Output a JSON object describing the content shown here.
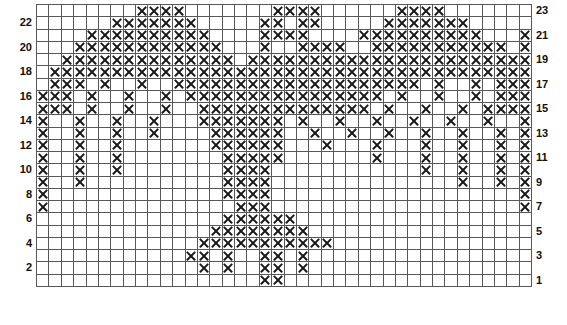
{
  "chart": {
    "title": "",
    "type": "knitting-colorwork-chart",
    "columns": 40,
    "rows": 23,
    "symbol_on": "X",
    "symbol_off": "",
    "colors": {
      "grid_line": "#58585a",
      "symbol": "#1a1a1a",
      "cell_background": "#ffffff",
      "label": "#0f0f0f"
    },
    "row_labels_left": [
      "22",
      "20",
      "18",
      "16",
      "14",
      "12",
      "10",
      "8",
      "6",
      "4",
      "2"
    ],
    "row_labels_right": [
      "23",
      "21",
      "19",
      "17",
      "15",
      "13",
      "11",
      "9",
      "7",
      "5",
      "3",
      "1"
    ],
    "row_number_order": "bottom-to-top",
    "rows_data": [
      {
        "row": 23,
        "label": "23",
        "label_side": "right",
        "cells": [
          0,
          0,
          0,
          0,
          0,
          0,
          0,
          0,
          1,
          1,
          1,
          1,
          0,
          0,
          0,
          0,
          0,
          0,
          0,
          1,
          1,
          1,
          1,
          0,
          0,
          0,
          0,
          0,
          0,
          1,
          1,
          1,
          1,
          0,
          0,
          0,
          0,
          0,
          0,
          0
        ]
      },
      {
        "row": 22,
        "label": "22",
        "label_side": "left",
        "cells": [
          0,
          0,
          0,
          0,
          0,
          0,
          1,
          1,
          1,
          1,
          1,
          1,
          1,
          0,
          0,
          0,
          0,
          0,
          1,
          1,
          0,
          1,
          1,
          0,
          0,
          0,
          0,
          0,
          1,
          1,
          1,
          1,
          1,
          1,
          1,
          0,
          0,
          0,
          0,
          0
        ]
      },
      {
        "row": 21,
        "label": "21",
        "label_side": "right",
        "cells": [
          0,
          0,
          0,
          0,
          1,
          1,
          1,
          1,
          1,
          1,
          1,
          1,
          1,
          1,
          0,
          0,
          0,
          0,
          1,
          1,
          1,
          1,
          0,
          0,
          0,
          0,
          1,
          1,
          1,
          1,
          1,
          1,
          1,
          1,
          1,
          1,
          0,
          0,
          0,
          1
        ]
      },
      {
        "row": 20,
        "label": "20",
        "label_side": "left",
        "cells": [
          0,
          0,
          0,
          1,
          1,
          1,
          1,
          1,
          1,
          1,
          1,
          1,
          1,
          1,
          1,
          0,
          0,
          0,
          1,
          0,
          0,
          1,
          1,
          1,
          1,
          0,
          0,
          1,
          1,
          1,
          1,
          1,
          1,
          1,
          1,
          1,
          1,
          1,
          0,
          1
        ]
      },
      {
        "row": 19,
        "label": "19",
        "label_side": "right",
        "cells": [
          0,
          0,
          1,
          1,
          1,
          1,
          1,
          1,
          1,
          1,
          1,
          1,
          1,
          1,
          1,
          1,
          0,
          1,
          1,
          1,
          1,
          1,
          1,
          1,
          1,
          1,
          1,
          1,
          1,
          1,
          1,
          1,
          1,
          1,
          1,
          1,
          1,
          1,
          1,
          1
        ]
      },
      {
        "row": 18,
        "label": "18",
        "label_side": "left",
        "cells": [
          0,
          1,
          1,
          1,
          1,
          1,
          1,
          1,
          1,
          1,
          1,
          1,
          1,
          1,
          1,
          1,
          1,
          1,
          1,
          1,
          1,
          1,
          1,
          1,
          1,
          1,
          1,
          1,
          1,
          1,
          1,
          1,
          1,
          1,
          1,
          1,
          1,
          1,
          1,
          1
        ]
      },
      {
        "row": 17,
        "label": "17",
        "label_side": "right",
        "cells": [
          0,
          1,
          1,
          1,
          0,
          1,
          0,
          0,
          1,
          0,
          0,
          1,
          1,
          1,
          1,
          1,
          1,
          1,
          1,
          1,
          1,
          1,
          1,
          1,
          1,
          1,
          1,
          1,
          1,
          1,
          1,
          0,
          1,
          0,
          0,
          1,
          0,
          1,
          1,
          1
        ]
      },
      {
        "row": 16,
        "label": "16",
        "label_side": "left",
        "cells": [
          1,
          1,
          1,
          0,
          1,
          0,
          0,
          1,
          0,
          0,
          1,
          0,
          1,
          1,
          1,
          1,
          1,
          1,
          1,
          1,
          1,
          1,
          1,
          1,
          1,
          1,
          1,
          1,
          0,
          1,
          0,
          0,
          1,
          0,
          0,
          1,
          0,
          1,
          1,
          1
        ]
      },
      {
        "row": 15,
        "label": "15",
        "label_side": "right",
        "cells": [
          1,
          1,
          1,
          0,
          1,
          0,
          0,
          1,
          0,
          0,
          1,
          0,
          0,
          1,
          1,
          1,
          1,
          1,
          1,
          1,
          1,
          1,
          1,
          1,
          1,
          1,
          1,
          0,
          1,
          0,
          0,
          1,
          0,
          0,
          1,
          0,
          1,
          1,
          1,
          1
        ]
      },
      {
        "row": 14,
        "label": "14",
        "label_side": "left",
        "cells": [
          1,
          0,
          0,
          1,
          0,
          0,
          1,
          0,
          0,
          1,
          0,
          0,
          0,
          1,
          1,
          1,
          1,
          1,
          1,
          1,
          0,
          1,
          0,
          0,
          1,
          0,
          0,
          1,
          0,
          0,
          1,
          0,
          0,
          1,
          0,
          0,
          1,
          0,
          0,
          1
        ]
      },
      {
        "row": 13,
        "label": "13",
        "label_side": "right",
        "cells": [
          1,
          0,
          0,
          1,
          0,
          0,
          1,
          0,
          0,
          1,
          0,
          0,
          0,
          0,
          1,
          1,
          1,
          1,
          1,
          1,
          0,
          0,
          1,
          0,
          0,
          1,
          0,
          0,
          1,
          0,
          0,
          1,
          0,
          0,
          1,
          0,
          0,
          1,
          0,
          1
        ]
      },
      {
        "row": 12,
        "label": "12",
        "label_side": "left",
        "cells": [
          1,
          0,
          0,
          1,
          0,
          0,
          1,
          0,
          0,
          0,
          0,
          0,
          0,
          0,
          1,
          1,
          1,
          1,
          1,
          1,
          0,
          0,
          0,
          1,
          0,
          0,
          0,
          1,
          0,
          0,
          0,
          1,
          0,
          0,
          1,
          0,
          0,
          1,
          0,
          1
        ]
      },
      {
        "row": 11,
        "label": "11",
        "label_side": "right",
        "cells": [
          1,
          0,
          0,
          1,
          0,
          0,
          1,
          0,
          0,
          0,
          0,
          0,
          0,
          0,
          0,
          1,
          1,
          1,
          1,
          1,
          0,
          0,
          0,
          0,
          0,
          0,
          0,
          1,
          0,
          0,
          0,
          1,
          0,
          0,
          1,
          0,
          0,
          1,
          0,
          1
        ]
      },
      {
        "row": 10,
        "label": "10",
        "label_side": "left",
        "cells": [
          1,
          0,
          0,
          1,
          0,
          0,
          1,
          0,
          0,
          0,
          0,
          0,
          0,
          0,
          0,
          1,
          1,
          1,
          1,
          0,
          0,
          0,
          0,
          0,
          0,
          0,
          0,
          0,
          0,
          0,
          0,
          1,
          0,
          0,
          1,
          0,
          0,
          1,
          0,
          1
        ]
      },
      {
        "row": 9,
        "label": "9",
        "label_side": "right",
        "cells": [
          1,
          0,
          0,
          1,
          0,
          0,
          0,
          0,
          0,
          0,
          0,
          0,
          0,
          0,
          0,
          1,
          1,
          1,
          1,
          0,
          0,
          0,
          0,
          0,
          0,
          0,
          0,
          0,
          0,
          0,
          0,
          0,
          0,
          0,
          1,
          0,
          0,
          1,
          0,
          1
        ]
      },
      {
        "row": 8,
        "label": "8",
        "label_side": "left",
        "cells": [
          1,
          0,
          0,
          0,
          0,
          0,
          0,
          0,
          0,
          0,
          0,
          0,
          0,
          0,
          0,
          1,
          1,
          1,
          1,
          0,
          0,
          0,
          0,
          0,
          0,
          0,
          0,
          0,
          0,
          0,
          0,
          0,
          0,
          0,
          0,
          0,
          0,
          0,
          0,
          1
        ]
      },
      {
        "row": 7,
        "label": "7",
        "label_side": "right",
        "cells": [
          1,
          0,
          0,
          0,
          0,
          0,
          0,
          0,
          0,
          0,
          0,
          0,
          0,
          0,
          0,
          0,
          1,
          1,
          1,
          0,
          0,
          0,
          0,
          0,
          0,
          0,
          0,
          0,
          0,
          0,
          0,
          0,
          0,
          0,
          0,
          0,
          0,
          0,
          0,
          1
        ]
      },
      {
        "row": 6,
        "label": "6",
        "label_side": "left",
        "cells": [
          0,
          0,
          0,
          0,
          0,
          0,
          0,
          0,
          0,
          0,
          0,
          0,
          0,
          0,
          0,
          1,
          1,
          1,
          1,
          1,
          1,
          0,
          0,
          0,
          0,
          0,
          0,
          0,
          0,
          0,
          0,
          0,
          0,
          0,
          0,
          0,
          0,
          0,
          0,
          0
        ]
      },
      {
        "row": 5,
        "label": "5",
        "label_side": "right",
        "cells": [
          0,
          0,
          0,
          0,
          0,
          0,
          0,
          0,
          0,
          0,
          0,
          0,
          0,
          0,
          1,
          1,
          1,
          1,
          1,
          1,
          1,
          1,
          0,
          0,
          0,
          0,
          0,
          0,
          0,
          0,
          0,
          0,
          0,
          0,
          0,
          0,
          0,
          0,
          0,
          0
        ]
      },
      {
        "row": 4,
        "label": "4",
        "label_side": "left",
        "cells": [
          0,
          0,
          0,
          0,
          0,
          0,
          0,
          0,
          0,
          0,
          0,
          0,
          0,
          1,
          1,
          1,
          1,
          1,
          1,
          1,
          1,
          1,
          1,
          1,
          0,
          0,
          0,
          0,
          0,
          0,
          0,
          0,
          0,
          0,
          0,
          0,
          0,
          0,
          0,
          0
        ]
      },
      {
        "row": 3,
        "label": "3",
        "label_side": "right",
        "cells": [
          0,
          0,
          0,
          0,
          0,
          0,
          0,
          0,
          0,
          0,
          0,
          0,
          1,
          1,
          0,
          1,
          0,
          0,
          1,
          1,
          0,
          1,
          0,
          0,
          0,
          0,
          0,
          0,
          0,
          0,
          0,
          0,
          0,
          0,
          0,
          0,
          0,
          0,
          0,
          0
        ]
      },
      {
        "row": 2,
        "label": "2",
        "label_side": "left",
        "cells": [
          0,
          0,
          0,
          0,
          0,
          0,
          0,
          0,
          0,
          0,
          0,
          0,
          0,
          1,
          0,
          1,
          0,
          0,
          1,
          1,
          0,
          1,
          0,
          0,
          0,
          0,
          0,
          0,
          0,
          0,
          0,
          0,
          0,
          0,
          0,
          0,
          0,
          0,
          0,
          0
        ]
      },
      {
        "row": 1,
        "label": "1",
        "label_side": "right",
        "cells": [
          0,
          0,
          0,
          0,
          0,
          0,
          0,
          0,
          0,
          0,
          0,
          0,
          0,
          0,
          0,
          0,
          0,
          0,
          1,
          1,
          0,
          0,
          0,
          0,
          0,
          0,
          0,
          0,
          0,
          0,
          0,
          0,
          0,
          0,
          0,
          0,
          0,
          0,
          0,
          0
        ]
      }
    ]
  }
}
